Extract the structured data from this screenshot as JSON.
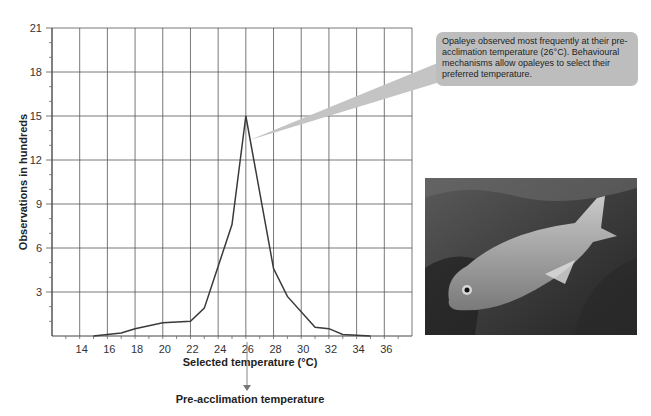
{
  "chart_data": {
    "type": "line",
    "title": "",
    "xlabel": "Selected temperature (°C)",
    "ylabel": "Observations in hundreds",
    "xlim": [
      12,
      38
    ],
    "ylim": [
      0,
      21
    ],
    "x_ticks": [
      14,
      16,
      18,
      20,
      22,
      24,
      26,
      28,
      30,
      32,
      34,
      36
    ],
    "y_ticks": [
      3,
      6,
      9,
      12,
      15,
      18,
      21
    ],
    "grid": true,
    "series": [
      {
        "name": "Opaleye observations",
        "x": [
          15,
          16,
          17,
          18,
          20,
          22,
          23,
          25,
          26,
          28,
          29,
          31,
          32,
          33,
          35
        ],
        "y": [
          0.0,
          0.1,
          0.2,
          0.5,
          0.9,
          1.0,
          1.9,
          7.6,
          15.0,
          4.6,
          2.7,
          0.6,
          0.5,
          0.1,
          0.0
        ]
      }
    ],
    "annotations": [
      {
        "text": "Opaleye observed most frequently at their pre-acclimation temperature (26°C). Behavioural mechanisms allow opaleyes to select their preferred temperature.",
        "points_to": {
          "x": 26,
          "y": 15
        }
      },
      {
        "text": "Pre-acclimation temperature",
        "points_to": {
          "x": 26
        }
      }
    ]
  },
  "labels": {
    "x_axis_title": "Selected temperature (°C)",
    "y_axis_title": "Observations in hundreds",
    "callout": "Opaleye observed most frequently at their pre-acclimation temperature (26°C). Behavioural mechanisms allow opaleyes to select their preferred temperature.",
    "pre_acclimation": "Pre-acclimation temperature"
  },
  "image": {
    "subject": "opaleye fish photograph"
  },
  "colors": {
    "grid": "#555555",
    "line": "#3a3a3a",
    "callout_bg": "#bdbdbd",
    "arrow": "#888888"
  }
}
